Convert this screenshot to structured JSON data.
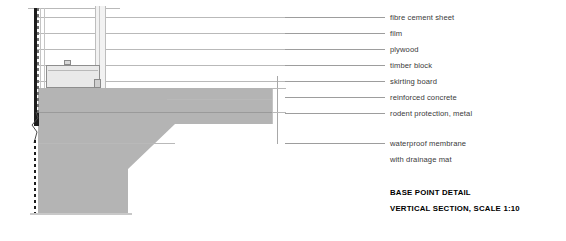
{
  "drawing": {
    "title": "BASE POINT DETAIL",
    "subtitle": "VERTICAL SECTION, SCALE 1:10",
    "scale": "1:10",
    "section_type": "VERTICAL SECTION",
    "colors": {
      "concrete_fill": "#b4b4b4",
      "skirting_fill": "#e9e9e9",
      "cladding_fill": "#f2f2f2",
      "membrane": "#1c1c1c",
      "leader_line": "#9d9d9d",
      "label_text": "#3a3a3a",
      "title_text": "#000000",
      "background": "#ffffff"
    },
    "annotations": [
      {
        "id": "fibre-cement-sheet",
        "label": "fibre cement sheet",
        "y": 17,
        "leader_x1": 285,
        "leader_x2": 385
      },
      {
        "id": "film",
        "label": "film",
        "y": 33,
        "leader_x1": 285,
        "leader_x2": 385
      },
      {
        "id": "plywood",
        "label": "plywood",
        "y": 49,
        "leader_x1": 285,
        "leader_x2": 385
      },
      {
        "id": "timber-block",
        "label": "timber block",
        "y": 65,
        "leader_x1": 285,
        "leader_x2": 385
      },
      {
        "id": "skirting-board",
        "label": "skirting board",
        "y": 81,
        "leader_x1": 285,
        "leader_x2": 385
      },
      {
        "id": "reinforced-concrete",
        "label": "reinforced concrete",
        "y": 97,
        "leader_x1": 285,
        "leader_x2": 385
      },
      {
        "id": "rodent-protection",
        "label": "rodent protection, metal",
        "y": 113,
        "leader_x1": 285,
        "leader_x2": 385
      },
      {
        "id": "waterproof-membrane",
        "label": "waterproof membrane",
        "y": 143,
        "leader_x1": 285,
        "leader_x2": 385
      },
      {
        "id": "drainage-mat",
        "label": "with drainage mat",
        "y": 159,
        "leader_x1": null,
        "leader_x2": null
      }
    ],
    "title_block": {
      "x": 390,
      "title_y": 192,
      "subtitle_y": 208
    },
    "geometry": {
      "slab": {
        "x": 38,
        "y": 88,
        "w": 234,
        "h": 36
      },
      "slab_step": {
        "x": 38,
        "y": 124,
        "w": 90,
        "h": 89
      },
      "chamfer_from_x": 128,
      "chamfer_to_x": 175,
      "skirting": {
        "x": 46,
        "y": 65,
        "w": 54,
        "h": 23
      },
      "cladding_band": {
        "x": 95,
        "y": 6,
        "w": 11,
        "h": 82
      },
      "membrane_x": 34,
      "membrane_top_y": 8,
      "membrane_bottom_y": 216
    }
  }
}
